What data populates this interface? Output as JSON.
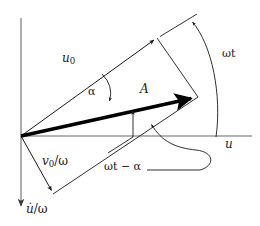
{
  "figure": {
    "width": 260,
    "height": 226,
    "background": "#ffffff",
    "stroke_color": "#1a1a1a",
    "axis_color": "#8a8a8a",
    "thick_vector_color": "#000000"
  },
  "axes": {
    "horizontal": {
      "name": "horizontal-axis",
      "label": "u",
      "label_meaning": "displacement axis",
      "y": 136,
      "x_start": 21,
      "x_end": 252
    },
    "vertical": {
      "name": "vertical-axis",
      "label": "u̇/ω",
      "label_head": "u̇",
      "label_tail": "/ω",
      "label_meaning": "velocity over omega axis",
      "x": 21,
      "y_start": 18,
      "y_end": 214,
      "arrow_direction": "down"
    }
  },
  "vectors": [
    {
      "name": "u0-vector",
      "label": "u",
      "label_sub": "0",
      "style": "thin",
      "from": [
        21,
        136
      ],
      "to": [
        157,
        38
      ],
      "arrowhead": true
    },
    {
      "name": "A-vector",
      "label": "A",
      "style": "thick",
      "from": [
        21,
        136
      ],
      "to": [
        198,
        97
      ],
      "arrowhead": true
    },
    {
      "name": "v0-over-omega-vector",
      "label": "v",
      "label_sub": "0",
      "label_tail": "/ω",
      "style": "thin",
      "from": [
        21,
        136
      ],
      "to": [
        53,
        194
      ],
      "arrowhead": true
    }
  ],
  "construction_lines": [
    {
      "name": "parallelogram-side-top-right",
      "from": [
        157,
        38
      ],
      "to": [
        198,
        97
      ]
    },
    {
      "name": "parallelogram-side-bottom",
      "from": [
        53,
        194
      ],
      "to": [
        198,
        97
      ]
    },
    {
      "name": "extension-tick-line",
      "from": [
        160,
        36
      ],
      "to": [
        196,
        14
      ]
    }
  ],
  "angles": [
    {
      "name": "angle-alpha",
      "label": "α",
      "between": [
        "u0-vector",
        "A-vector"
      ],
      "arc_from": [
        103,
        74
      ],
      "arc_to": [
        109,
        104
      ],
      "arrowhead_at": "A-vector"
    },
    {
      "name": "angle-omega-t",
      "label": "ωt",
      "between": [
        "horizontal-axis",
        "u0-vector"
      ],
      "arc_from": [
        216,
        136
      ],
      "arc_to": [
        190,
        20
      ],
      "arrowhead_at": "u0-vector-extension"
    },
    {
      "name": "angle-omega-t-minus-alpha",
      "label": "ωt − α",
      "label_parts": [
        "ω",
        "t",
        "−",
        "α"
      ],
      "between": [
        "horizontal-axis",
        "A-vector"
      ],
      "leader_to": [
        148,
        122
      ],
      "pointer_up_from": [
        133,
        136
      ],
      "pointer_up_to": [
        133,
        109
      ]
    }
  ],
  "labels": {
    "u0": {
      "base": "u",
      "sub": "0"
    },
    "alpha": "α",
    "A": "A",
    "omega_t": "ωt",
    "u_axis": "u",
    "v0_over_omega": {
      "base": "v",
      "sub": "0",
      "tail": "/ω"
    },
    "omega_t_minus_alpha": "ωt − α",
    "udot_over_omega": {
      "base": "u̇",
      "tail": "/ω"
    }
  }
}
